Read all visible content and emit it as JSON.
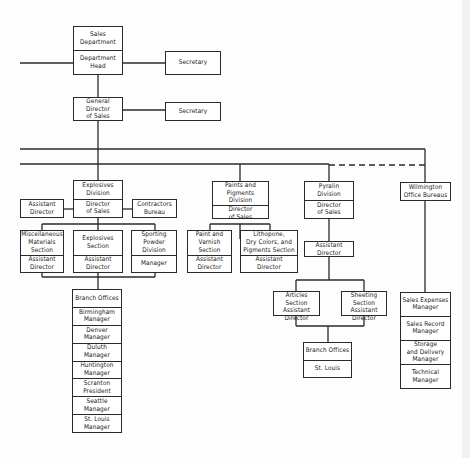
{
  "colors": {
    "line": "#2a2a2a",
    "background": "#fdfdfd"
  },
  "top": {
    "sales_department": {
      "name": "Sales Department",
      "role": "Department Head"
    },
    "secretary_1": "Secretary",
    "general_director": "General Director\nof Sales",
    "secretary_2": "Secretary"
  },
  "explosives": {
    "division": {
      "name": "Explosives\nDivision",
      "role": "Director\nof Sales"
    },
    "assistant_director": "Assistant\nDirector",
    "contractors_bureau": "Contractors\nBureau",
    "misc_materials": {
      "name": "Miscellaneous\nMaterials\nSection",
      "role": "Assistant\nDirector"
    },
    "explosives_section": {
      "name": "Explosives\nSection",
      "role": "Assistant\nDirector"
    },
    "sporting_powder": {
      "name": "Sporting Powder\nDivision",
      "role": "Manager"
    },
    "branch_offices": {
      "header": "Branch Offices",
      "items": [
        "Birmingham\nManager",
        "Denver\nManager",
        "Duluth\nManager",
        "Huntington\nManager",
        "Scranton\nPresident",
        "Seattle\nManager",
        "St. Louis\nManager"
      ]
    }
  },
  "paints": {
    "division": {
      "name": "Paints and Pigments\nDivision",
      "role": "Director\nof Sales"
    },
    "paint_varnish": {
      "name": "Paint and Varnish\nSection",
      "role": "Assistant\nDirector"
    },
    "lithopone": {
      "name": "Lithopone,\nDry Colors, and\nPigments Section",
      "role": "Assistant\nDirector"
    }
  },
  "pyralin": {
    "division": {
      "name": "Pyralin\nDivision",
      "role": "Director\nof Sales"
    },
    "assistant_director": "Assistant\nDirector",
    "articles": "Articles Section\nAssistant\nDirector",
    "sheeting": "Sheeting Section\nAssistant\nDirector",
    "branch_offices": {
      "header": "Branch Offices",
      "location": "St. Louis"
    }
  },
  "wilmington": {
    "bureau": "Wilmington\nOffice Bureaus",
    "managers": [
      "Sales Expenses\nManager",
      "Sales Record\nManager",
      "Storage\nand Delivery\nManager",
      "Technical\nManager"
    ]
  }
}
